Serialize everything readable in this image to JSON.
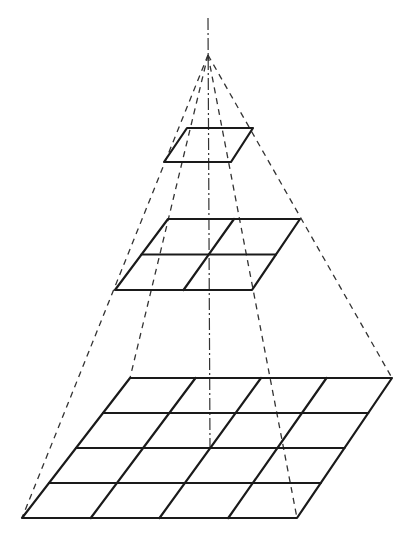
{
  "diagram": {
    "title": "",
    "colors": {
      "line": "#1a1a1a",
      "background": "#ffffff"
    },
    "apex": [
      208,
      55
    ],
    "axis": {
      "from": [
        208,
        18
      ],
      "to": [
        210,
        448
      ]
    },
    "levels": [
      {
        "name": "top",
        "divisions": 1,
        "tl": [
          187,
          128
        ],
        "tr": [
          253,
          128
        ],
        "br": [
          231,
          162
        ],
        "bl": [
          164,
          162
        ]
      },
      {
        "name": "middle",
        "divisions": 2,
        "tl": [
          168,
          219
        ],
        "tr": [
          300,
          219
        ],
        "br": [
          252,
          290
        ],
        "bl": [
          115,
          290
        ]
      },
      {
        "name": "bottom",
        "divisions": 4,
        "tl": [
          130,
          378
        ],
        "tr": [
          392,
          378
        ],
        "br": [
          297,
          518
        ],
        "bl": [
          22,
          518
        ]
      }
    ]
  }
}
